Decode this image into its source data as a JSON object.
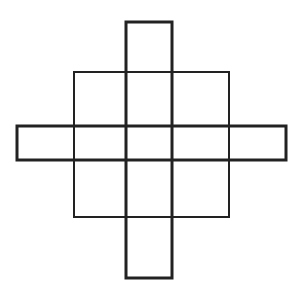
{
  "diagram": {
    "title": "",
    "background": "#ffffff",
    "stroke_color": "#222222",
    "shapes": [
      {
        "id": "square",
        "x": 74,
        "y": 72,
        "w": 155,
        "h": 145,
        "stroke_width": 2
      },
      {
        "id": "vertical-bar",
        "x": 126,
        "y": 22,
        "w": 46,
        "h": 256,
        "stroke_width": 3
      },
      {
        "id": "horizontal-bar",
        "x": 17,
        "y": 126,
        "w": 269,
        "h": 34,
        "stroke_width": 3
      }
    ]
  }
}
